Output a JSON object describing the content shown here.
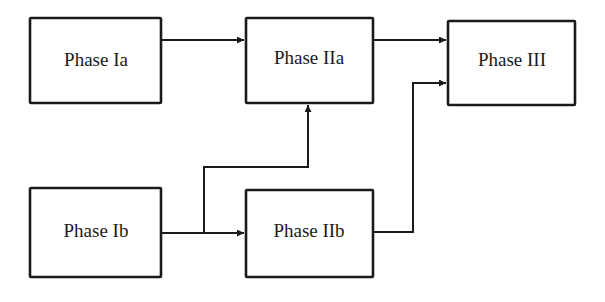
{
  "diagram": {
    "nodes": [
      {
        "id": "ia",
        "label": "Phase Ia"
      },
      {
        "id": "iia",
        "label": "Phase IIa"
      },
      {
        "id": "iii",
        "label": "Phase III"
      },
      {
        "id": "ib",
        "label": "Phase Ib"
      },
      {
        "id": "iib",
        "label": "Phase IIb"
      }
    ],
    "edges": [
      {
        "from": "ia",
        "to": "iia"
      },
      {
        "from": "iia",
        "to": "iii"
      },
      {
        "from": "ib",
        "to": "iib"
      },
      {
        "from": "ib",
        "to": "iia"
      },
      {
        "from": "iib",
        "to": "iii"
      }
    ]
  }
}
